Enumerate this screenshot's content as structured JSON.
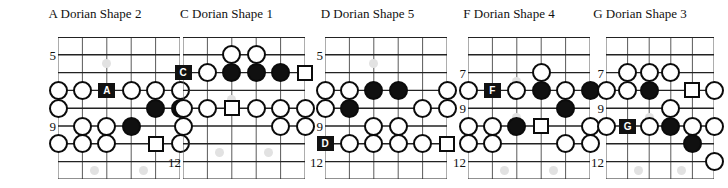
{
  "page": {
    "kind": "guitar-scale-shape-diagrams",
    "width": 713,
    "height": 188
  },
  "style": {
    "line_color": "#5a5a5a",
    "fret_line_color": "#222222",
    "marker_outline": "#0b0b0b",
    "marker_fill_open": "#ffffff",
    "marker_fill_closed": "#101010",
    "root_box_bg": "#111111",
    "root_box_text": "#ffffff",
    "inlay_color": "#e2e2e2",
    "text_color": "#111111"
  },
  "geometry": {
    "strings": 6,
    "frets_shown": 8,
    "string_spacing": 21,
    "fret_spacing": 17.8,
    "grid_top": 37,
    "marker_diameter": 19,
    "square_size": 16,
    "root_box_w": 17,
    "root_box_h": 15
  },
  "diagrams": [
    {
      "id": "a-dorian-shape-2",
      "title": "A Dorian Shape 2",
      "left": 10,
      "grid_left": 48,
      "grid_width": 122,
      "fret_numbers": [
        {
          "label": "5",
          "fret_index": 1,
          "x": 20
        },
        {
          "label": "7",
          "fret_index": 3,
          "x": 20
        },
        {
          "label": "9",
          "fret_index": 5,
          "x": 20
        }
      ],
      "inlays": [
        {
          "fret_index": 1,
          "string_index": 2,
          "double": false
        },
        {
          "fret_index": 7,
          "string_index": 1,
          "double": true
        }
      ],
      "markers": [
        {
          "fret_index": 3,
          "string_index": 0,
          "type": "open"
        },
        {
          "fret_index": 3,
          "string_index": 1,
          "type": "open"
        },
        {
          "fret_index": 3,
          "string_index": 2,
          "type": "root",
          "label": "A"
        },
        {
          "fret_index": 3,
          "string_index": 3,
          "type": "open"
        },
        {
          "fret_index": 3,
          "string_index": 4,
          "type": "open"
        },
        {
          "fret_index": 3,
          "string_index": 5,
          "type": "open"
        },
        {
          "fret_index": 4,
          "string_index": 0,
          "type": "open"
        },
        {
          "fret_index": 4,
          "string_index": 4,
          "type": "filled"
        },
        {
          "fret_index": 4,
          "string_index": 5,
          "type": "filled"
        },
        {
          "fret_index": 5,
          "string_index": 1,
          "type": "open"
        },
        {
          "fret_index": 5,
          "string_index": 2,
          "type": "open"
        },
        {
          "fret_index": 5,
          "string_index": 3,
          "type": "filled"
        },
        {
          "fret_index": 6,
          "string_index": 0,
          "type": "open"
        },
        {
          "fret_index": 6,
          "string_index": 1,
          "type": "open"
        },
        {
          "fret_index": 6,
          "string_index": 2,
          "type": "open"
        },
        {
          "fret_index": 6,
          "string_index": 4,
          "type": "square"
        },
        {
          "fret_index": 6,
          "string_index": 5,
          "type": "open"
        }
      ]
    },
    {
      "id": "c-dorian-shape-1",
      "title": "C Dorian Shape 1",
      "left": 148,
      "grid_left": 35,
      "grid_width": 122,
      "fret_numbers": [
        {
          "label": "7",
          "fret_index": 2,
          "x": 8
        },
        {
          "label": "9",
          "fret_index": 4,
          "x": 8
        },
        {
          "label": "12",
          "fret_index": 7,
          "x": 2
        }
      ],
      "inlays": [
        {
          "fret_index": 3,
          "string_index": 2,
          "double": false
        },
        {
          "fret_index": 6,
          "string_index": 1,
          "double": true
        }
      ],
      "markers": [
        {
          "fret_index": 1,
          "string_index": 2,
          "type": "open"
        },
        {
          "fret_index": 1,
          "string_index": 3,
          "type": "open"
        },
        {
          "fret_index": 2,
          "string_index": 0,
          "type": "root",
          "label": "C"
        },
        {
          "fret_index": 2,
          "string_index": 1,
          "type": "open"
        },
        {
          "fret_index": 2,
          "string_index": 2,
          "type": "filled"
        },
        {
          "fret_index": 2,
          "string_index": 3,
          "type": "filled"
        },
        {
          "fret_index": 2,
          "string_index": 4,
          "type": "filled"
        },
        {
          "fret_index": 2,
          "string_index": 5,
          "type": "square"
        },
        {
          "fret_index": 4,
          "string_index": 0,
          "type": "open"
        },
        {
          "fret_index": 4,
          "string_index": 1,
          "type": "open"
        },
        {
          "fret_index": 4,
          "string_index": 2,
          "type": "square"
        },
        {
          "fret_index": 4,
          "string_index": 3,
          "type": "open"
        },
        {
          "fret_index": 4,
          "string_index": 4,
          "type": "open"
        },
        {
          "fret_index": 4,
          "string_index": 5,
          "type": "open"
        },
        {
          "fret_index": 5,
          "string_index": 0,
          "type": "open"
        },
        {
          "fret_index": 5,
          "string_index": 4,
          "type": "open"
        },
        {
          "fret_index": 5,
          "string_index": 5,
          "type": "open"
        }
      ]
    },
    {
      "id": "d-dorian-shape-5",
      "title": "D Dorian Shape 5",
      "left": 288,
      "grid_left": 37,
      "grid_width": 122,
      "fret_numbers": [
        {
          "label": "5",
          "fret_index": 1,
          "x": 9
        },
        {
          "label": "7",
          "fret_index": 3,
          "x": 9
        },
        {
          "label": "9",
          "fret_index": 5,
          "x": 9
        },
        {
          "label": "12",
          "fret_index": 7,
          "x": 3
        }
      ],
      "inlays": [
        {
          "fret_index": 1,
          "string_index": 2,
          "double": false
        }
      ],
      "markers": [
        {
          "fret_index": 3,
          "string_index": 0,
          "type": "open"
        },
        {
          "fret_index": 3,
          "string_index": 1,
          "type": "open"
        },
        {
          "fret_index": 3,
          "string_index": 2,
          "type": "filled"
        },
        {
          "fret_index": 3,
          "string_index": 3,
          "type": "filled"
        },
        {
          "fret_index": 3,
          "string_index": 5,
          "type": "open"
        },
        {
          "fret_index": 4,
          "string_index": 0,
          "type": "open"
        },
        {
          "fret_index": 4,
          "string_index": 1,
          "type": "filled"
        },
        {
          "fret_index": 4,
          "string_index": 4,
          "type": "open"
        },
        {
          "fret_index": 4,
          "string_index": 5,
          "type": "open"
        },
        {
          "fret_index": 5,
          "string_index": 2,
          "type": "open"
        },
        {
          "fret_index": 5,
          "string_index": 3,
          "type": "open"
        },
        {
          "fret_index": 6,
          "string_index": 0,
          "type": "root",
          "label": "D"
        },
        {
          "fret_index": 6,
          "string_index": 1,
          "type": "open"
        },
        {
          "fret_index": 6,
          "string_index": 2,
          "type": "open"
        },
        {
          "fret_index": 6,
          "string_index": 3,
          "type": "open"
        },
        {
          "fret_index": 6,
          "string_index": 4,
          "type": "open"
        },
        {
          "fret_index": 6,
          "string_index": 5,
          "type": "square"
        }
      ]
    },
    {
      "id": "f-dorian-shape-4",
      "title": "F Dorian Shape 4",
      "left": 428,
      "grid_left": 40,
      "grid_width": 122,
      "fret_numbers": [
        {
          "label": "7",
          "fret_index": 2,
          "x": 12
        },
        {
          "label": "9",
          "fret_index": 4,
          "x": 12
        },
        {
          "label": "12",
          "fret_index": 7,
          "x": 5
        }
      ],
      "inlays": [
        {
          "fret_index": 2,
          "string_index": 2,
          "double": false
        },
        {
          "fret_index": 4,
          "string_index": 2,
          "double": false
        },
        {
          "fret_index": 7,
          "string_index": 1,
          "double": true
        }
      ],
      "markers": [
        {
          "fret_index": 2,
          "string_index": 3,
          "type": "open"
        },
        {
          "fret_index": 3,
          "string_index": 0,
          "type": "open"
        },
        {
          "fret_index": 3,
          "string_index": 1,
          "type": "root",
          "label": "F"
        },
        {
          "fret_index": 3,
          "string_index": 2,
          "type": "open"
        },
        {
          "fret_index": 3,
          "string_index": 3,
          "type": "filled"
        },
        {
          "fret_index": 3,
          "string_index": 4,
          "type": "open"
        },
        {
          "fret_index": 3,
          "string_index": 5,
          "type": "filled"
        },
        {
          "fret_index": 4,
          "string_index": 4,
          "type": "filled"
        },
        {
          "fret_index": 5,
          "string_index": 0,
          "type": "open"
        },
        {
          "fret_index": 5,
          "string_index": 1,
          "type": "open"
        },
        {
          "fret_index": 5,
          "string_index": 2,
          "type": "filled"
        },
        {
          "fret_index": 5,
          "string_index": 3,
          "type": "square"
        },
        {
          "fret_index": 5,
          "string_index": 5,
          "type": "open"
        },
        {
          "fret_index": 6,
          "string_index": 0,
          "type": "open"
        },
        {
          "fret_index": 6,
          "string_index": 1,
          "type": "open"
        },
        {
          "fret_index": 6,
          "string_index": 4,
          "type": "open"
        },
        {
          "fret_index": 6,
          "string_index": 5,
          "type": "open"
        }
      ]
    },
    {
      "id": "g-dorian-shape-3",
      "title": "G Dorian Shape 3",
      "left": 566,
      "grid_left": 40,
      "grid_width": 108,
      "fret_numbers": [
        {
          "label": "7",
          "fret_index": 2,
          "x": 12
        },
        {
          "label": "9",
          "fret_index": 4,
          "x": 12
        },
        {
          "label": "12",
          "fret_index": 7,
          "x": 3
        }
      ],
      "inlays": [
        {
          "fret_index": 4,
          "string_index": 2,
          "double": false
        },
        {
          "fret_index": 7,
          "string_index": 1,
          "double": true
        }
      ],
      "markers": [
        {
          "fret_index": 2,
          "string_index": 1,
          "type": "open"
        },
        {
          "fret_index": 2,
          "string_index": 2,
          "type": "open"
        },
        {
          "fret_index": 2,
          "string_index": 3,
          "type": "open"
        },
        {
          "fret_index": 3,
          "string_index": 0,
          "type": "open"
        },
        {
          "fret_index": 3,
          "string_index": 1,
          "type": "open"
        },
        {
          "fret_index": 3,
          "string_index": 2,
          "type": "filled"
        },
        {
          "fret_index": 3,
          "string_index": 4,
          "type": "square"
        },
        {
          "fret_index": 3,
          "string_index": 5,
          "type": "open"
        },
        {
          "fret_index": 4,
          "string_index": 3,
          "type": "open"
        },
        {
          "fret_index": 5,
          "string_index": 0,
          "type": "open"
        },
        {
          "fret_index": 5,
          "string_index": 1,
          "type": "root",
          "label": "G"
        },
        {
          "fret_index": 5,
          "string_index": 2,
          "type": "open"
        },
        {
          "fret_index": 5,
          "string_index": 3,
          "type": "filled"
        },
        {
          "fret_index": 5,
          "string_index": 4,
          "type": "open"
        },
        {
          "fret_index": 5,
          "string_index": 5,
          "type": "open"
        },
        {
          "fret_index": 6,
          "string_index": 4,
          "type": "filled"
        },
        {
          "fret_index": 7,
          "string_index": 5,
          "type": "open"
        }
      ]
    }
  ]
}
